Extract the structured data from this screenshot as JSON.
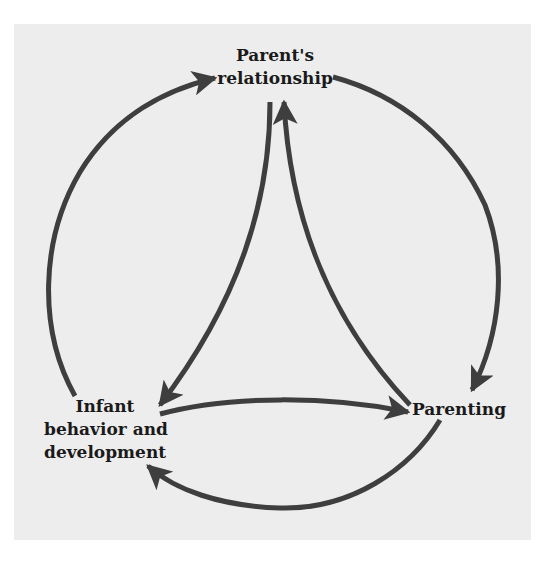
{
  "diagram": {
    "type": "cyclic-influence-diagram",
    "colors": {
      "background": "#ededed",
      "arrow": "#3e3e3e",
      "text": "#1a1a1a"
    },
    "nodes": [
      {
        "id": "parents",
        "lines": [
          "Parent's",
          "relationship"
        ]
      },
      {
        "id": "parenting",
        "lines": [
          "Parenting"
        ]
      },
      {
        "id": "infant",
        "lines": [
          "Infant",
          "behavior and",
          "development"
        ]
      }
    ],
    "edges": [
      {
        "from": "infant",
        "to": "parents",
        "path": "outer-left-arc"
      },
      {
        "from": "parents",
        "to": "parenting",
        "path": "outer-right-arc"
      },
      {
        "from": "parenting",
        "to": "infant",
        "path": "outer-bottom-arc"
      },
      {
        "from": "parents",
        "to": "infant",
        "path": "inner-left"
      },
      {
        "from": "parenting",
        "to": "parents",
        "path": "inner-right"
      },
      {
        "from": "infant",
        "to": "parenting",
        "path": "inner-bottom"
      }
    ]
  }
}
